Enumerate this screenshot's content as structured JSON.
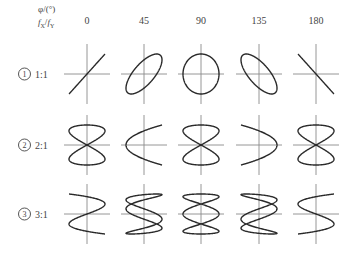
{
  "header": {
    "phase_label": "φ/(°)",
    "freq_label_fx": "f",
    "freq_sub_x": "X",
    "freq_sep": "/",
    "freq_label_fy": "f",
    "freq_sub_y": "Y"
  },
  "columns": [
    {
      "label": "0",
      "phase": 0,
      "cx": 87
    },
    {
      "label": "45",
      "phase": 45,
      "cx": 144
    },
    {
      "label": "90",
      "phase": 90,
      "cx": 201
    },
    {
      "label": "135",
      "phase": 135,
      "cx": 259
    },
    {
      "label": "180",
      "phase": 180,
      "cx": 316
    }
  ],
  "rows": [
    {
      "index": "1",
      "ratio": "1:1",
      "n": 1,
      "cy": 74
    },
    {
      "index": "2",
      "ratio": "2:1",
      "n": 2,
      "cy": 145
    },
    {
      "index": "3",
      "ratio": "3:1",
      "n": 3,
      "cy": 214
    }
  ],
  "style": {
    "axis_color": "#8a8a8a",
    "curve_color": "#2a2a2a"
  }
}
